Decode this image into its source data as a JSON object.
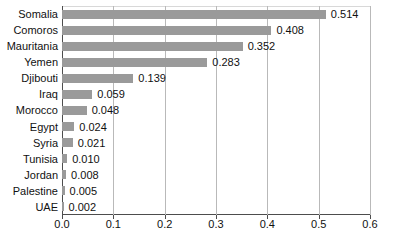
{
  "chart_data": {
    "type": "bar",
    "orientation": "horizontal",
    "title": "",
    "xlabel": "",
    "ylabel": "",
    "categories": [
      "Somalia",
      "Comoros",
      "Mauritania",
      "Yemen",
      "Djibouti",
      "Iraq",
      "Morocco",
      "Egypt",
      "Syria",
      "Tunisia",
      "Jordan",
      "Palestine",
      "UAE"
    ],
    "values": [
      0.514,
      0.408,
      0.352,
      0.283,
      0.139,
      0.059,
      0.048,
      0.024,
      0.021,
      0.01,
      0.008,
      0.005,
      0.002
    ],
    "value_labels": [
      "0.514",
      "0.408",
      "0.352",
      "0.283",
      "0.139",
      "0.059",
      "0.048",
      "0.024",
      "0.021",
      "0.010",
      "0.008",
      "0.005",
      "0.002"
    ],
    "xlim": [
      0.0,
      0.6
    ],
    "xticks": [
      0.0,
      0.1,
      0.2,
      0.3,
      0.4,
      0.5,
      0.6
    ],
    "xtick_labels": [
      "0.0",
      "0.1",
      "0.2",
      "0.3",
      "0.4",
      "0.5",
      "0.6"
    ],
    "grid": true,
    "legend": null,
    "bar_color": "#9a9a9a",
    "grid_color": "#b9b9b9",
    "axis_color": "#4d4d4d",
    "text_color": "#111111",
    "background": "#ffffff"
  }
}
